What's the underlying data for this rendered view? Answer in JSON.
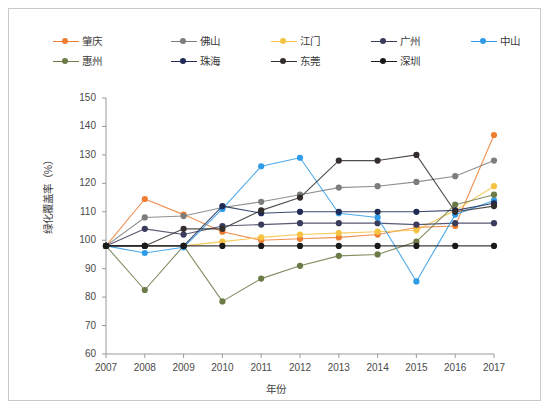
{
  "chart_data": {
    "type": "line",
    "title": "",
    "xlabel": "年份",
    "ylabel": "绿化覆盖率（%）",
    "x": [
      2007,
      2008,
      2009,
      2010,
      2011,
      2012,
      2013,
      2014,
      2015,
      2016,
      2017
    ],
    "xtick_labels": [
      "2007",
      "2008",
      "2009",
      "2010",
      "2011",
      "2012",
      "2013",
      "2014",
      "2015",
      "2016",
      "2017"
    ],
    "ytick_labels": [
      "150",
      "140",
      "130",
      "120",
      "110",
      "100",
      "90",
      "80",
      "70",
      "60"
    ],
    "ylim": [
      60,
      150
    ],
    "xlim": [
      2007,
      2017
    ],
    "ystep": 10,
    "grid": false,
    "legend_position": "top",
    "marker": "circle",
    "series": [
      {
        "name": "肇庆",
        "color": "#ED7D31",
        "values": [
          98,
          114.5,
          109,
          103,
          100,
          100.5,
          101,
          102,
          104.5,
          105,
          137
        ]
      },
      {
        "name": "佛山",
        "color": "#7D7D7D",
        "values": [
          98,
          108,
          108.5,
          111.5,
          113.5,
          116,
          118.5,
          119,
          120.5,
          122.5,
          128
        ]
      },
      {
        "name": "江门",
        "color": "#F5C242",
        "values": [
          98,
          98,
          98,
          99.5,
          101,
          102,
          102.5,
          103,
          103.5,
          110.5,
          119
        ]
      },
      {
        "name": "广州",
        "color": "#3B3B5C",
        "values": [
          98,
          104,
          102,
          105,
          105.5,
          106,
          106,
          106,
          105.5,
          106,
          106
        ]
      },
      {
        "name": "中山",
        "color": "#2E9BE8",
        "values": [
          98,
          95.5,
          97.5,
          111,
          126,
          129,
          109.5,
          108,
          85.5,
          109,
          114
        ]
      },
      {
        "name": "惠州",
        "color": "#6B7A46",
        "values": [
          98,
          82.5,
          98,
          78.5,
          86.5,
          91,
          94.5,
          95,
          99.5,
          112.5,
          116
        ]
      },
      {
        "name": "珠海",
        "color": "#1F2A55",
        "values": [
          98,
          98,
          98,
          112,
          109.5,
          110,
          110,
          110,
          110,
          110.5,
          113
        ]
      },
      {
        "name": "东莞",
        "color": "#332E2C",
        "values": [
          98,
          98,
          104,
          104,
          110.5,
          115,
          128,
          128,
          130,
          110,
          112
        ]
      },
      {
        "name": "深圳",
        "color": "#1A1A1A",
        "values": [
          98,
          98,
          98,
          98,
          98,
          98,
          98,
          98,
          98,
          98,
          98
        ]
      }
    ]
  },
  "legend": {
    "items": [
      {
        "label": "肇庆",
        "color": "#ED7D31"
      },
      {
        "label": "佛山",
        "color": "#7D7D7D"
      },
      {
        "label": "江门",
        "color": "#F5C242"
      },
      {
        "label": "广州",
        "color": "#3B3B5C"
      },
      {
        "label": "中山",
        "color": "#2E9BE8"
      },
      {
        "label": "惠州",
        "color": "#6B7A46"
      },
      {
        "label": "珠海",
        "color": "#1F2A55"
      },
      {
        "label": "东莞",
        "color": "#332E2C"
      },
      {
        "label": "深圳",
        "color": "#1A1A1A"
      }
    ]
  },
  "axes": {
    "x_title": "年份",
    "y_title": "绿化覆盖率（%）"
  }
}
